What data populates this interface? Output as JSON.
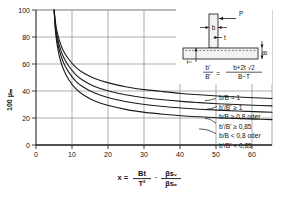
{
  "chart_data": {
    "type": "line",
    "title": "",
    "xlabel": "x = Bt/T² · βsᵥ/βsₒ",
    "ylabel": "100 μₘ",
    "xlim": [
      0,
      65
    ],
    "ylim": [
      0,
      100
    ],
    "xticks": [
      0,
      10,
      20,
      30,
      40,
      50,
      60
    ],
    "yticks": [
      0,
      20,
      40,
      60,
      80,
      100
    ],
    "xticklabels": [
      "0",
      "10",
      "20",
      "30",
      "40",
      "50",
      "60"
    ],
    "yticklabels": [
      "0",
      "20",
      "40",
      "60",
      "80",
      "100"
    ],
    "grid": true,
    "legend_position": "right-inside",
    "series": [
      {
        "name": "b/B = 1 ; b'/B' ≥ 1",
        "x": [
          5.0,
          5.3,
          5.8,
          6.5,
          7.5,
          9,
          11,
          13,
          16,
          20,
          25,
          30,
          35,
          40,
          45,
          50,
          55,
          60,
          65
        ],
        "y": [
          100,
          92,
          84,
          77,
          70,
          63.5,
          57.5,
          53.5,
          49.5,
          46,
          43,
          41,
          39.5,
          38.2,
          37.2,
          36.3,
          35.6,
          35.0,
          34.5
        ]
      },
      {
        "name": "b/B ≥ 0,8 oder b'/B' ≥ 0,85 (upper)",
        "x": [
          5.0,
          5.3,
          5.8,
          6.5,
          7.5,
          9,
          11,
          13,
          16,
          20,
          25,
          30,
          35,
          40,
          45,
          50,
          55,
          60,
          65
        ],
        "y": [
          100,
          90,
          81,
          73,
          65.5,
          58.5,
          52,
          47.8,
          43.6,
          40.0,
          37.0,
          35.0,
          33.5,
          32.3,
          31.4,
          30.6,
          30.0,
          29.4,
          29.0
        ]
      },
      {
        "name": "b/B ≥ 0,8 oder b'/B' ≥ 0,85 (lower)",
        "x": [
          5.0,
          5.3,
          5.8,
          6.5,
          7.5,
          9,
          11,
          13,
          16,
          20,
          25,
          30,
          35,
          40,
          45,
          50,
          55,
          60,
          65
        ],
        "y": [
          100,
          88,
          78,
          69.5,
          61.5,
          54,
          47.2,
          43.0,
          38.7,
          35.0,
          32.0,
          30.0,
          28.5,
          27.4,
          26.5,
          25.8,
          25.2,
          24.7,
          24.3
        ]
      },
      {
        "name": "b/B < 0,8 oder b'/B' < 0,85",
        "x": [
          5.0,
          5.3,
          5.8,
          6.5,
          7.5,
          9,
          11,
          13,
          16,
          20,
          25,
          30,
          35,
          40,
          45,
          50,
          55,
          60,
          65
        ],
        "y": [
          100,
          86,
          74.5,
          65,
          56.5,
          48.5,
          41.5,
          37.2,
          32.8,
          29.2,
          26.2,
          24.2,
          22.8,
          21.7,
          20.9,
          20.2,
          19.7,
          19.2,
          18.8
        ]
      }
    ],
    "legend_entries": [
      {
        "line1": "b/B = 1",
        "line2": "b'/B' ≥ 1"
      },
      {
        "line1": "b/B ≥ 0,8 oder",
        "line2": "b'/B' ≥ 0,85"
      },
      {
        "line1": "b/B < 0,8 oder",
        "line2": "b'/B' < 0,85"
      }
    ]
  },
  "axes": {
    "y_label": "100 μₘ",
    "y_label_prefix": "100",
    "y_label_symbol": "μₘ",
    "x_ticks": [
      "0",
      "10",
      "20",
      "30",
      "40",
      "50",
      "60"
    ],
    "y_ticks": [
      "0",
      "20",
      "40",
      "60",
      "80",
      "100"
    ],
    "x_zero_left": "0"
  },
  "formula": {
    "equals_lhs": "x =",
    "num1": "Bt",
    "den1": "T²",
    "num2": "βsᵥ",
    "den2": "βsₒ",
    "multiply": "·"
  },
  "legend": {
    "items": [
      {
        "id": "legend-item-1",
        "line1": "b/B = 1",
        "line2": "b'/B' ≥ 1"
      },
      {
        "id": "legend-item-2",
        "line1": "b/B ≥ 0,8 oder",
        "line2": "b'/B' ≥ 0,85"
      },
      {
        "id": "legend-item-3",
        "line1": "b/B < 0,8 oder",
        "line2": "b'/B' < 0,85"
      }
    ],
    "l1": "b/B = 1",
    "l2": "b'/B' ≥ 1",
    "l3": "b/B ≥ 0,8 oder",
    "l4": "b'/B' ≥ 0,85",
    "l5": "b/B < 0,8 oder",
    "l6": "b'/B' < 0,85"
  },
  "inset": {
    "load_label": "P",
    "web_width_label": "b",
    "web_thickness_label": "t",
    "flange_thickness_label": "T",
    "flange_depth_label": "B",
    "ratio_num_left": "b'",
    "ratio_den_left": "B'",
    "ratio_equals": "=",
    "ratio_num_right": "b+2t √2",
    "ratio_den_right": "B−T"
  },
  "colors": {
    "curve": "#1a1a1a",
    "grid": "#8a8a8a",
    "axis": "#111111",
    "background": "#ffffff",
    "inset_fill": "#f2f2f2"
  }
}
